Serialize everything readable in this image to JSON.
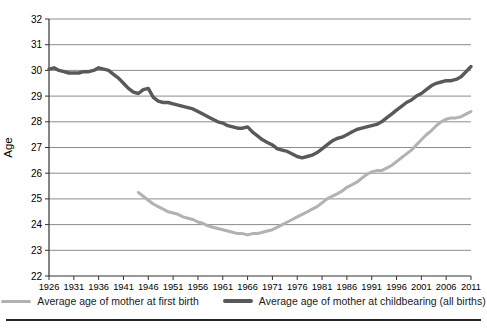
{
  "chart_data": {
    "type": "line",
    "title": "",
    "ylabel": "Age",
    "ylim": [
      22,
      32
    ],
    "ytick_step": 1,
    "x_range": [
      1926,
      2011
    ],
    "x_ticks": [
      1926,
      1931,
      1936,
      1941,
      1946,
      1951,
      1956,
      1961,
      1966,
      1971,
      1976,
      1981,
      1986,
      1991,
      1996,
      2001,
      2006,
      2011
    ],
    "grid": "horizontal",
    "legend_position": "bottom",
    "colors": {
      "grid": "#8c8c8c",
      "axis": "#333333",
      "tick_text": "#000000"
    },
    "series": [
      {
        "name": "Average age of mother at first birth",
        "color": "#b2b2b2",
        "start_year": 1944,
        "values": [
          25.25,
          25.1,
          24.95,
          24.8,
          24.7,
          24.6,
          24.5,
          24.45,
          24.4,
          24.3,
          24.25,
          24.2,
          24.1,
          24.05,
          23.95,
          23.9,
          23.85,
          23.8,
          23.75,
          23.7,
          23.65,
          23.65,
          23.6,
          23.65,
          23.65,
          23.7,
          23.75,
          23.8,
          23.9,
          24.0,
          24.1,
          24.2,
          24.3,
          24.4,
          24.5,
          24.6,
          24.7,
          24.85,
          25.0,
          25.1,
          25.2,
          25.3,
          25.45,
          25.55,
          25.65,
          25.8,
          25.95,
          26.05,
          26.1,
          26.1,
          26.2,
          26.3,
          26.45,
          26.6,
          26.75,
          26.9,
          27.1,
          27.3,
          27.5,
          27.65,
          27.85,
          28.0,
          28.1,
          28.15,
          28.15,
          28.2,
          28.3,
          28.4
        ]
      },
      {
        "name": "Average age of mother at childbearing (all births)",
        "color": "#595959",
        "start_year": 1926,
        "values": [
          30.05,
          30.1,
          30.0,
          29.95,
          29.9,
          29.9,
          29.9,
          29.95,
          29.95,
          30.0,
          30.1,
          30.05,
          30.0,
          29.85,
          29.7,
          29.5,
          29.3,
          29.15,
          29.1,
          29.25,
          29.3,
          28.95,
          28.8,
          28.75,
          28.75,
          28.7,
          28.65,
          28.6,
          28.55,
          28.5,
          28.4,
          28.3,
          28.2,
          28.1,
          28.0,
          27.95,
          27.85,
          27.8,
          27.75,
          27.75,
          27.8,
          27.6,
          27.45,
          27.3,
          27.2,
          27.1,
          26.95,
          26.9,
          26.85,
          26.75,
          26.65,
          26.6,
          26.65,
          26.7,
          26.8,
          26.95,
          27.1,
          27.25,
          27.35,
          27.4,
          27.5,
          27.6,
          27.7,
          27.75,
          27.8,
          27.85,
          27.9,
          28.0,
          28.15,
          28.3,
          28.45,
          28.6,
          28.75,
          28.85,
          29.0,
          29.1,
          29.25,
          29.4,
          29.5,
          29.55,
          29.6,
          29.6,
          29.65,
          29.75,
          29.95,
          30.15
        ]
      }
    ]
  }
}
